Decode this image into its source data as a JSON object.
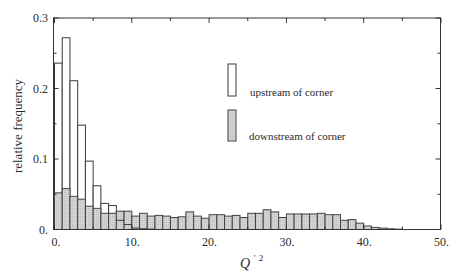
{
  "chart_data": {
    "type": "bar",
    "subtype": "overlaid-histogram",
    "title": "",
    "xlabel": "Q'^2",
    "ylabel": "relative frequency",
    "xlim": [
      0,
      50
    ],
    "ylim": [
      0,
      0.3
    ],
    "x_ticks": [
      0,
      10,
      20,
      30,
      40,
      50
    ],
    "x_tick_labels": [
      "0.",
      "10.",
      "20.",
      "30.",
      "40.",
      "50."
    ],
    "y_ticks": [
      0,
      0.1,
      0.2,
      0.3
    ],
    "y_tick_labels": [
      "0.",
      "0.1",
      "0.2",
      "0.3"
    ],
    "minor_x_ticks": [
      5,
      15,
      25,
      35,
      45
    ],
    "minor_y_ticks": [
      0.05,
      0.15,
      0.25
    ],
    "grid": false,
    "legend_position": "upper-center",
    "bin_width": 1,
    "bin_start": 0,
    "series": [
      {
        "name": "upstream of corner",
        "style": "white-fill",
        "values": [
          0.236,
          0.272,
          0.211,
          0.148,
          0.097,
          0.062,
          0.037,
          0.034,
          0.013,
          0.007,
          0.002,
          0.001,
          0.0005
        ]
      },
      {
        "name": "downstream of corner",
        "style": "grey-fill",
        "values": [
          0.052,
          0.058,
          0.047,
          0.043,
          0.033,
          0.03,
          0.023,
          0.023,
          0.026,
          0.026,
          0.019,
          0.023,
          0.019,
          0.02,
          0.019,
          0.017,
          0.018,
          0.025,
          0.019,
          0.016,
          0.021,
          0.021,
          0.019,
          0.02,
          0.017,
          0.023,
          0.023,
          0.028,
          0.025,
          0.017,
          0.022,
          0.022,
          0.022,
          0.022,
          0.023,
          0.021,
          0.021,
          0.013,
          0.014,
          0.009,
          0.005,
          0.003,
          0.002,
          0.001,
          0.0005
        ]
      }
    ]
  },
  "legend": {
    "items": [
      {
        "label": "upstream of corner",
        "swatch": "white"
      },
      {
        "label": "downstream of corner",
        "swatch": "grey"
      }
    ]
  },
  "axes": {
    "xlabel_main": "Q",
    "xlabel_prime": "'",
    "xlabel_sup": "2",
    "ylabel": "relative frequency"
  },
  "colors": {
    "frame": "#333333",
    "white_bar_fill": "#ffffff",
    "white_bar_stroke": "#3a3a3a",
    "grey_bar_fill": "#d3d3d3",
    "grey_bar_stroke": "#444444",
    "text": "#2a2a2a"
  }
}
